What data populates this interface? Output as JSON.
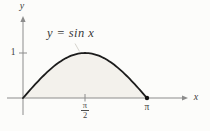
{
  "figure": {
    "annotation": "y = sin x",
    "x_axis_label": "x",
    "y_axis_label": "y",
    "y_tick_label": "1",
    "x_tick_half_pi_numerator": "π",
    "x_tick_half_pi_denominator": "2",
    "x_tick_pi_label": "π"
  },
  "chart_data": {
    "type": "area",
    "title": "y = sin x",
    "equation": "y = sin x",
    "function_name": "sin",
    "xlabel": "x",
    "ylabel": "y",
    "x_range": [
      0,
      3.14159265
    ],
    "y_range": [
      0,
      1
    ],
    "grid": false,
    "x_ticks": [
      {
        "value": 1.57079633,
        "label": "π/2"
      },
      {
        "value": 3.14159265,
        "label": "π"
      }
    ],
    "y_ticks": [
      {
        "value": 1,
        "label": "1"
      }
    ],
    "marked_point": {
      "x": 3.14159265,
      "y": 0
    },
    "shaded_region": "area under y = sin x between x = 0 and x = π",
    "colors": {
      "curve": "#1c1c1c",
      "area_fill": "#f3f1ec",
      "axis": "#8c8c8c",
      "text": "#3c3c3c",
      "point": "#111111"
    },
    "samples_x_y": [
      [
        0,
        0
      ],
      [
        0.3927,
        0.3827
      ],
      [
        0.7854,
        0.7071
      ],
      [
        1.1781,
        0.9239
      ],
      [
        1.5708,
        1.0
      ],
      [
        1.9635,
        0.9239
      ],
      [
        2.3562,
        0.7071
      ],
      [
        2.7489,
        0.3827
      ],
      [
        3.1416,
        0
      ]
    ]
  }
}
